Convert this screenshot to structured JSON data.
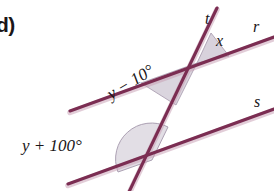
{
  "figure": {
    "part_label": "d)",
    "type": "geometry-diagram",
    "colors": {
      "line": "#7B2D52",
      "line_shadow": "#b48aa0",
      "wedge_fill": "#d6d0da",
      "wedge_stroke": "#9a8fa2",
      "text": "#1a1618",
      "background": "#ffffff"
    },
    "lines": [
      {
        "name": "r",
        "label": "r",
        "role": "parallel-line-upper",
        "x1": 70,
        "y1": 111,
        "x2": 274,
        "y2": 37
      },
      {
        "name": "s",
        "label": "s",
        "role": "parallel-line-lower",
        "x1": 68,
        "y1": 184,
        "x2": 274,
        "y2": 109
      },
      {
        "name": "t",
        "label": "t",
        "role": "transversal",
        "x1": 217,
        "y1": 8,
        "x2": 128,
        "y2": 194
      }
    ],
    "intersections": [
      {
        "name": "upper",
        "lines": [
          "r",
          "t"
        ],
        "x": 197,
        "y": 63
      },
      {
        "name": "lower",
        "lines": [
          "s",
          "t"
        ],
        "x": 152,
        "y": 160
      }
    ],
    "angles": [
      {
        "name": "x",
        "label": "x",
        "at": "upper",
        "position": "above line r, right of transversal t",
        "marker": "shaded-wedge"
      },
      {
        "name": "y-minus-10",
        "label": "y − 10°",
        "at": "upper",
        "position": "below line r, left of transversal t",
        "marker": "shaded-wedge",
        "text_rotation_deg": -31
      },
      {
        "name": "y-plus-100",
        "label": "y + 100°",
        "at": "lower",
        "position": "above line s, left of transversal t",
        "marker": "shaded-arc"
      }
    ]
  }
}
